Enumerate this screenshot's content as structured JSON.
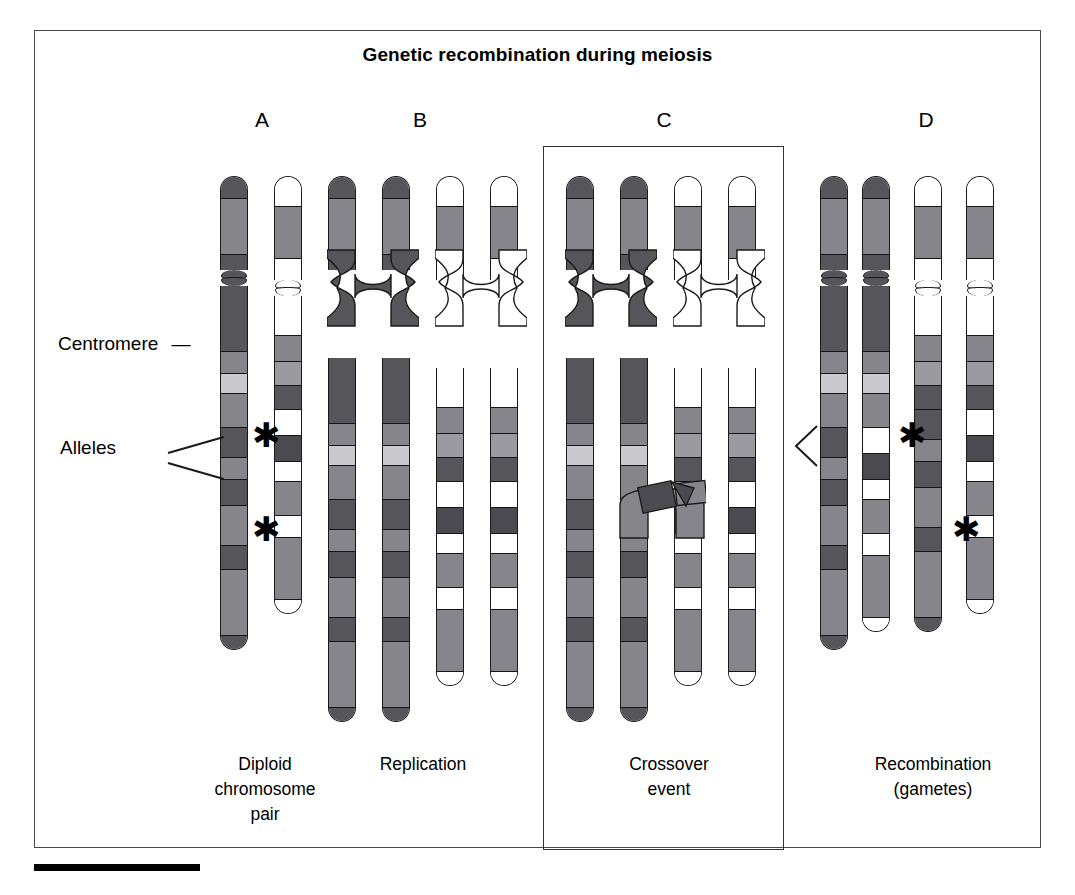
{
  "figure": {
    "title": "Genetic recombination during meiosis",
    "stages": [
      {
        "letter": "A",
        "caption": "Diploid\nchromosome\npair"
      },
      {
        "letter": "B",
        "caption": "Replication"
      },
      {
        "letter": "C",
        "caption": "Crossover\nevent"
      },
      {
        "letter": "D",
        "caption": "Recombination\n(gametes)"
      }
    ],
    "annotations": {
      "centromere_label": "Centromere",
      "centromere_dash": "—",
      "alleles_label": "Alleles",
      "allele_marker": "✱",
      "gamete_pointer": "<"
    },
    "colors": {
      "dark": "#55555a",
      "darker": "#4a4a50",
      "mid": "#85858b",
      "light": "#9a9aa0",
      "pale": "#c9c9cd",
      "white": "#ffffff",
      "outline": "#1a1a1a",
      "frame": "#4a4a4a",
      "bar": "#000000"
    }
  },
  "chromosomes": {
    "A": [
      {
        "name": "maternal-homolog",
        "p": [
          [
            22,
            "dark"
          ],
          [
            56,
            "mid"
          ],
          [
            16,
            "dark"
          ]
        ],
        "q": [
          [
            66,
            "dark"
          ],
          [
            22,
            "mid"
          ],
          [
            20,
            "pale"
          ],
          [
            34,
            "mid"
          ],
          [
            30,
            "dark"
          ],
          [
            22,
            "mid"
          ],
          [
            26,
            "dark"
          ],
          [
            40,
            "mid"
          ],
          [
            24,
            "dark"
          ],
          [
            66,
            "mid"
          ],
          [
            14,
            "dark"
          ]
        ]
      },
      {
        "name": "paternal-homolog",
        "p": [
          [
            30,
            "white"
          ],
          [
            52,
            "mid"
          ],
          [
            22,
            "white"
          ]
        ],
        "q": [
          [
            40,
            "white"
          ],
          [
            26,
            "mid"
          ],
          [
            24,
            "light"
          ],
          [
            24,
            "dark"
          ],
          [
            26,
            "white"
          ],
          [
            26,
            "darker"
          ],
          [
            20,
            "white"
          ],
          [
            34,
            "mid"
          ],
          [
            22,
            "white"
          ],
          [
            62,
            "mid"
          ],
          [
            14,
            "white"
          ]
        ]
      }
    ],
    "B": [
      {
        "name": "maternal-chromatid-1",
        "copy_of": "maternal-homolog"
      },
      {
        "name": "maternal-chromatid-2",
        "copy_of": "maternal-homolog"
      },
      {
        "name": "paternal-chromatid-1",
        "copy_of": "paternal-homolog"
      },
      {
        "name": "paternal-chromatid-2",
        "copy_of": "paternal-homolog"
      }
    ],
    "C": [
      {
        "name": "maternal-chromatid-1"
      },
      {
        "name": "maternal-chromatid-2-crossing"
      },
      {
        "name": "paternal-chromatid-1-crossing"
      },
      {
        "name": "paternal-chromatid-2"
      }
    ],
    "D": [
      {
        "name": "gamete-1-parental",
        "p": [
          [
            22,
            "dark"
          ],
          [
            56,
            "mid"
          ],
          [
            16,
            "dark"
          ]
        ],
        "q": [
          [
            66,
            "dark"
          ],
          [
            22,
            "mid"
          ],
          [
            20,
            "pale"
          ],
          [
            34,
            "mid"
          ],
          [
            30,
            "dark"
          ],
          [
            22,
            "mid"
          ],
          [
            26,
            "dark"
          ],
          [
            40,
            "mid"
          ],
          [
            24,
            "dark"
          ],
          [
            66,
            "mid"
          ],
          [
            14,
            "dark"
          ]
        ]
      },
      {
        "name": "gamete-2-recombinant",
        "p": [
          [
            22,
            "dark"
          ],
          [
            56,
            "mid"
          ],
          [
            16,
            "dark"
          ]
        ],
        "q": [
          [
            66,
            "dark"
          ],
          [
            22,
            "mid"
          ],
          [
            20,
            "pale"
          ],
          [
            34,
            "mid"
          ],
          [
            26,
            "white"
          ],
          [
            26,
            "darker"
          ],
          [
            20,
            "white"
          ],
          [
            34,
            "mid"
          ],
          [
            22,
            "white"
          ],
          [
            62,
            "mid"
          ],
          [
            14,
            "white"
          ]
        ]
      },
      {
        "name": "gamete-3-recombinant",
        "p": [
          [
            30,
            "white"
          ],
          [
            52,
            "mid"
          ],
          [
            22,
            "white"
          ]
        ],
        "q": [
          [
            40,
            "white"
          ],
          [
            26,
            "mid"
          ],
          [
            24,
            "light"
          ],
          [
            24,
            "dark"
          ],
          [
            30,
            "dark"
          ],
          [
            22,
            "mid"
          ],
          [
            26,
            "dark"
          ],
          [
            40,
            "mid"
          ],
          [
            24,
            "dark"
          ],
          [
            66,
            "mid"
          ],
          [
            14,
            "dark"
          ]
        ]
      },
      {
        "name": "gamete-4-parental",
        "p": [
          [
            30,
            "white"
          ],
          [
            52,
            "mid"
          ],
          [
            22,
            "white"
          ]
        ],
        "q": [
          [
            40,
            "white"
          ],
          [
            26,
            "mid"
          ],
          [
            24,
            "light"
          ],
          [
            24,
            "dark"
          ],
          [
            26,
            "white"
          ],
          [
            26,
            "darker"
          ],
          [
            20,
            "white"
          ],
          [
            34,
            "mid"
          ],
          [
            22,
            "white"
          ],
          [
            62,
            "mid"
          ],
          [
            14,
            "white"
          ]
        ]
      }
    ]
  },
  "layout": {
    "stage_letter_y": 108,
    "caption_y": 752,
    "chrom_x": {
      "A": [
        220,
        274
      ],
      "B": [
        328,
        382,
        436,
        490
      ],
      "C": [
        566,
        620,
        674,
        728
      ],
      "D": [
        820,
        862,
        914,
        966
      ]
    },
    "letter_x": {
      "A": 232,
      "B": 390,
      "C": 634,
      "D": 896
    }
  }
}
